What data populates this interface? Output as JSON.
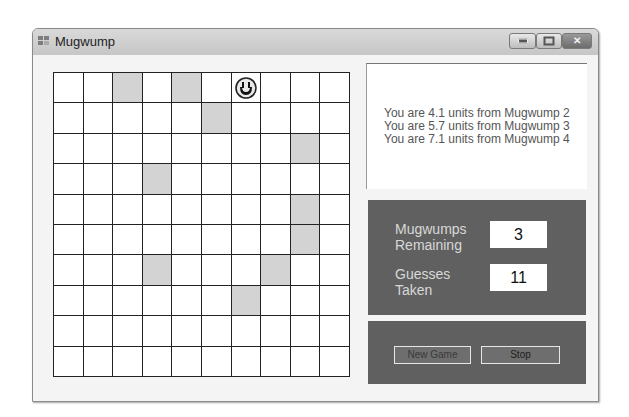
{
  "window": {
    "title": "Mugwump",
    "controls": {
      "minimize": "minimize",
      "maximize": "maximize",
      "close": "close"
    }
  },
  "grid": {
    "columns": 10,
    "rows": 10,
    "shaded_cells": [
      [
        0,
        2
      ],
      [
        0,
        4
      ],
      [
        1,
        5
      ],
      [
        2,
        8
      ],
      [
        3,
        3
      ],
      [
        4,
        8
      ],
      [
        5,
        8
      ],
      [
        6,
        3
      ],
      [
        6,
        7
      ],
      [
        7,
        6
      ]
    ],
    "mugwump_found": [
      0,
      6
    ],
    "shade_color": "#d3d3d3"
  },
  "messages": [
    "You are 4.1 units from Mugwump 2",
    "You are 5.7 units from Mugwump 3",
    "You are 7.1 units from Mugwump 4"
  ],
  "stats": {
    "remaining_label_1": "Mugwumps",
    "remaining_label_2": "Remaining",
    "remaining_value": "3",
    "guesses_label_1": "Guesses",
    "guesses_label_2": "Taken",
    "guesses_value": "11"
  },
  "buttons": {
    "new_game": "New Game",
    "stop": "Stop"
  },
  "colors": {
    "panel": "#606060",
    "panel_text": "#d8d8d8",
    "message_text": "#555555"
  }
}
